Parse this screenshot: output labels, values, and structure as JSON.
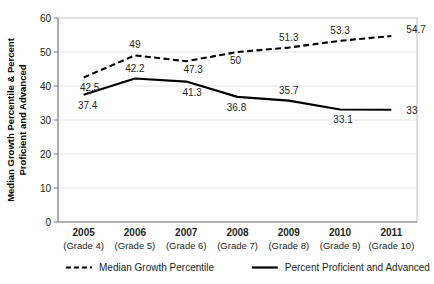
{
  "chart_data": {
    "type": "line",
    "title": "",
    "xlabel": "",
    "ylabel": "Median Growth Percentile & Percent Proficient and Advanced",
    "ylabel_line1": "Median Growth Percentile & Percent",
    "ylabel_line2": "Proficient and Advanced",
    "ylim": [
      0,
      60
    ],
    "ytick_labels": [
      "60",
      "50",
      "40",
      "30",
      "20",
      "10",
      "0"
    ],
    "ytick_values": [
      60,
      50,
      40,
      30,
      20,
      10,
      0
    ],
    "grid": true,
    "legend_position": "bottom",
    "categories": [
      "2005",
      "2006",
      "2007",
      "2008",
      "2009",
      "2010",
      "2011"
    ],
    "category_sublabels": [
      "(Grade 4)",
      "(Grade 5)",
      "(Grade 6)",
      "(Grade 7)",
      "(Grade 8)",
      "(Grade 9)",
      "(Grade 10)"
    ],
    "series": [
      {
        "name": "Median Growth Percentile",
        "style": "dashed",
        "color": "#000000",
        "values": [
          42.5,
          49,
          47.3,
          50,
          51.3,
          53.3,
          54.7
        ],
        "labels": [
          "42.5",
          "49",
          "47.3",
          "50",
          "51.3",
          "53.3",
          "54.7"
        ]
      },
      {
        "name": "Percent Proficient and Advanced",
        "style": "solid",
        "color": "#000000",
        "values": [
          37.4,
          42.2,
          41.3,
          36.8,
          35.7,
          33.1,
          33
        ],
        "labels": [
          "37.4",
          "42.2",
          "41.3",
          "36.8",
          "35.7",
          "33.1",
          "33"
        ]
      }
    ]
  },
  "legend": {
    "items": [
      {
        "label": "Median Growth Percentile",
        "style": "dashed"
      },
      {
        "label": "Percent Proficient and Advanced",
        "style": "solid"
      }
    ]
  }
}
